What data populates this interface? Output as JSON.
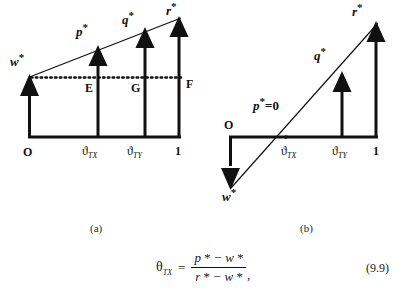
{
  "figure": {
    "panels": [
      {
        "id": "panel-a",
        "caption": "(a)",
        "axis_origin_label": "O",
        "axis_end_label": "1",
        "tick_labels": [
          {
            "theta": "ϑ",
            "subscript": "TX"
          },
          {
            "theta": "ϑ",
            "subscript": "TY"
          }
        ],
        "arrow_labels": [
          {
            "name": "w-star",
            "base": "w",
            "star": "*"
          },
          {
            "name": "p-star",
            "base": "p",
            "star": "*"
          },
          {
            "name": "q-star",
            "base": "q",
            "star": "*"
          },
          {
            "name": "r-star",
            "base": "r",
            "star": "*"
          }
        ],
        "point_labels": [
          "E",
          "G",
          "F"
        ]
      },
      {
        "id": "panel-b",
        "caption": "(b)",
        "axis_origin_label": "O",
        "axis_end_label": "1",
        "tick_labels": [
          {
            "theta": "ϑ",
            "subscript": "TX"
          },
          {
            "theta": "ϑ",
            "subscript": "TY"
          }
        ],
        "arrow_labels": [
          {
            "name": "w-star",
            "base": "w",
            "star": "*"
          },
          {
            "name": "q-star",
            "base": "q",
            "star": "*"
          },
          {
            "name": "r-star",
            "base": "r",
            "star": "*"
          }
        ],
        "zero_label": {
          "base": "p",
          "star": "*",
          "equals": "=0"
        }
      }
    ],
    "equation": {
      "lhs_theta": "θ",
      "lhs_subscript": "TX",
      "equals": "=",
      "numerator": "p * − w *",
      "denominator": "r * − w *",
      "trailing": ",",
      "number": "(9.9)"
    },
    "colors": {
      "ink": "#111111",
      "background": "#ffffff"
    }
  }
}
